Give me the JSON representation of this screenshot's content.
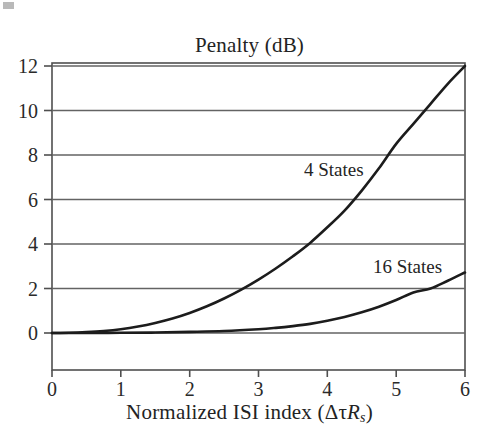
{
  "figure": {
    "background": "#ffffff",
    "line_color": "#1c1c1c",
    "axis_color": "#555555",
    "grid_color": "#6b6b6b"
  },
  "chart_data": {
    "type": "line",
    "title": "Penalty (dB)",
    "xlabel_prefix": "Normalized ISI index (",
    "xlabel_delta_tau": "Δτ",
    "xlabel_R": "R",
    "xlabel_sub": "s",
    "xlabel_suffix": ")",
    "xlabel_plain": "Normalized ISI index (ΔτRs)",
    "ylabel": "Penalty (dB)",
    "xlim": [
      0,
      6
    ],
    "ylim": [
      0,
      12
    ],
    "grid": true,
    "grid_axis": "y",
    "legend_position": "inline-annotation",
    "xticks": [
      "0",
      "1",
      "2",
      "3",
      "4",
      "5",
      "6"
    ],
    "yticks": [
      "0",
      "2",
      "4",
      "6",
      "8",
      "10",
      "12"
    ],
    "xtick_values": [
      0,
      1,
      2,
      3,
      4,
      5,
      6
    ],
    "ytick_values": [
      0,
      2,
      4,
      6,
      8,
      10,
      12
    ],
    "series": [
      {
        "name": "4 States",
        "label": "4 States",
        "color": "#1c1c1c",
        "x": [
          0,
          0.25,
          0.5,
          0.75,
          1.0,
          1.25,
          1.5,
          1.75,
          2.0,
          2.25,
          2.5,
          2.75,
          3.0,
          3.25,
          3.5,
          3.75,
          4.0,
          4.25,
          4.5,
          4.75,
          5.0,
          5.25,
          5.5,
          5.75,
          6.0
        ],
        "y": [
          0.0,
          0.01,
          0.04,
          0.09,
          0.17,
          0.29,
          0.45,
          0.65,
          0.9,
          1.2,
          1.55,
          1.95,
          2.4,
          2.9,
          3.45,
          4.05,
          4.75,
          5.5,
          6.4,
          7.4,
          8.5,
          9.4,
          10.3,
          11.2,
          12.0
        ]
      },
      {
        "name": "16 States",
        "label": "16 States",
        "color": "#1c1c1c",
        "x": [
          0,
          0.5,
          1.0,
          1.5,
          2.0,
          2.5,
          3.0,
          3.25,
          3.5,
          3.75,
          4.0,
          4.25,
          4.5,
          4.75,
          5.0,
          5.25,
          5.5,
          5.75,
          6.0
        ],
        "y": [
          0.0,
          0.0,
          0.01,
          0.02,
          0.05,
          0.09,
          0.17,
          0.23,
          0.31,
          0.41,
          0.55,
          0.72,
          0.93,
          1.18,
          1.48,
          1.82,
          2.0,
          2.35,
          2.72
        ]
      }
    ],
    "annotations": [
      {
        "text": "4 States",
        "x": 3.7,
        "y": 7.2
      },
      {
        "text": "16 States",
        "x": 5.1,
        "y": 3.4
      }
    ]
  }
}
